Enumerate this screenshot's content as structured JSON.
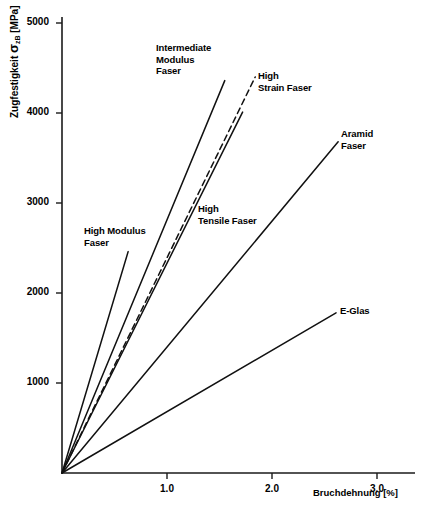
{
  "chart_data": {
    "type": "line",
    "title": "",
    "xlabel": "Bruchdehnung [%]",
    "ylabel_prefix": "Zugfestigkeit ",
    "ylabel_symbol": "σ",
    "ylabel_subscript": "zB",
    "ylabel_unit": " [MPa]",
    "ylabel_full": "Zugfestigkeit σzB [MPa]",
    "xlim": [
      0,
      3.45
    ],
    "ylim": [
      0,
      5350
    ],
    "xticks": [
      1.0,
      2.0,
      3.0
    ],
    "xticklabels": [
      "1.0",
      "2.0",
      "3.0"
    ],
    "yticks": [
      1000,
      2000,
      3000,
      4000,
      5000
    ],
    "yticklabels": [
      "1000",
      "2000",
      "3000",
      "4000",
      "5000"
    ],
    "grid": false,
    "legend": "inline-annotations",
    "series": [
      {
        "name": "High Modulus Faser",
        "label": "High Modulus\nFaser",
        "style": "solid",
        "x": [
          0.0,
          0.63
        ],
        "y": [
          0,
          2460
        ],
        "label_x": 84,
        "label_y": 225
      },
      {
        "name": "Intermediate Modulus Faser",
        "label": "Intermediate\nModulus\nFaser",
        "style": "solid",
        "x": [
          0.0,
          1.55
        ],
        "y": [
          0,
          4360
        ],
        "label_x": 156,
        "label_y": 42
      },
      {
        "name": "High Tensile Faser",
        "label": "High\nTensile Faser",
        "style": "solid",
        "x": [
          0.0,
          1.72
        ],
        "y": [
          0,
          4010
        ],
        "label_x": 198,
        "label_y": 203
      },
      {
        "name": "High Strain Faser",
        "label": "High\nStrain Faser",
        "style": "dashed",
        "x": [
          0.0,
          1.84
        ],
        "y": [
          0,
          4400
        ],
        "label_x": 258,
        "label_y": 70
      },
      {
        "name": "Aramid Faser",
        "label": "Aramid\nFaser",
        "style": "solid",
        "x": [
          0.0,
          2.63
        ],
        "y": [
          0,
          3680
        ],
        "label_x": 341,
        "label_y": 128
      },
      {
        "name": "E-Glas",
        "label": "E-Glas",
        "style": "solid",
        "x": [
          0.0,
          2.61
        ],
        "y": [
          0,
          1780
        ],
        "label_x": 340,
        "label_y": 305
      }
    ]
  },
  "axes": {
    "x_title": "Bruchdehnung [%]",
    "y_title": "Zugfestigkeit σzB [MPa]"
  }
}
